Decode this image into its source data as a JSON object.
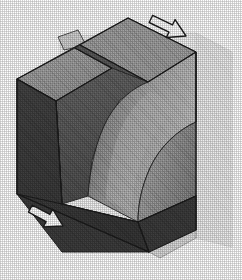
{
  "figure": {
    "title": "Isometric cube with curved section cut",
    "projection": "isometric",
    "background_color": "#ffffff",
    "render_style": "halftone-dither-grayscale"
  },
  "palette": {
    "background": "#ffffff",
    "cut_plane_far": "#f1f1f1",
    "cut_plane_near": "#e2e2e2",
    "top_face_left": "#9c9c9c",
    "top_face_right": "#8f8f8f",
    "front_left_face": "#3b3b3b",
    "front_right_face": "#3a3a3a",
    "inner_left_wall": "#5a5a5a",
    "swept_surface_light": "#adadad",
    "swept_surface_mid": "#8a8a8a",
    "swept_surface_dark": "#6b6b6b",
    "groove_shadow": "#4a4a4a",
    "outline": "#1a1a1a",
    "arrow_fill": "#ffffff",
    "arrow_stroke": "#1c1c1c"
  },
  "geometry": {
    "vertices": {
      "top": {
        "x": 128,
        "y": 18
      },
      "left": {
        "x": 17,
        "y": 79
      },
      "right": {
        "x": 196,
        "y": 122
      },
      "bottom": {
        "x": 149,
        "y": 252
      },
      "front_mid": {
        "x": 62,
        "y": 204
      },
      "left_lower": {
        "x": 17,
        "y": 194
      },
      "right_lower": {
        "x": 196,
        "y": 230
      }
    },
    "section_plane": {
      "label": "cutting-plane",
      "orientation": "vertical",
      "tab_upper_left": {
        "x": 60,
        "y": 36
      },
      "tab_lower_right": {
        "x": 196,
        "y": 238
      }
    },
    "swept_cut": {
      "label": "curved-sweep-surface",
      "type": "cylindrical-fillet"
    }
  },
  "annotations": {
    "arrows": [
      {
        "id": "arrow-top-right",
        "label": "section-direction-arrow-upper",
        "points_to": "down-left",
        "x": 164,
        "y": 22,
        "rotation_deg": 208
      },
      {
        "id": "arrow-bottom-left",
        "label": "section-direction-arrow-lower",
        "points_to": "up-right",
        "x": 30,
        "y": 222,
        "rotation_deg": 28
      }
    ]
  }
}
